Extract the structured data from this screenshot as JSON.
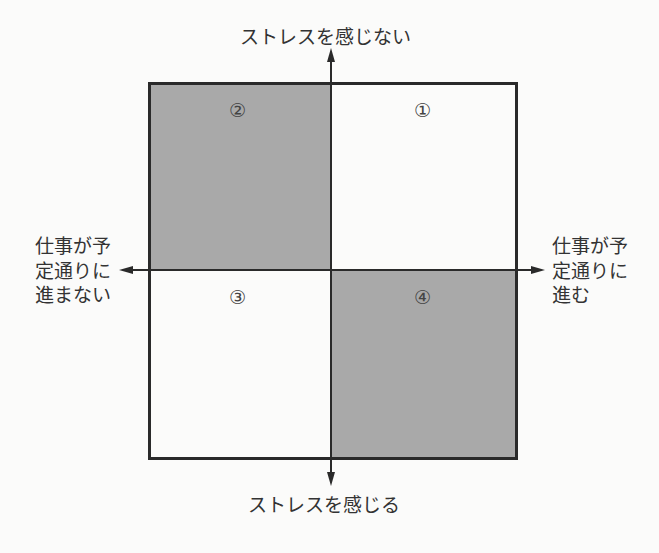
{
  "diagram": {
    "type": "quadrant-matrix",
    "axes": {
      "top": "ストレスを感じない",
      "bottom": "ストレスを感じる",
      "left": [
        "仕事が予",
        "定通りに",
        "進まない"
      ],
      "right": [
        "仕事が予",
        "定通りに",
        "進む"
      ]
    },
    "quadrants": [
      {
        "id": "q1",
        "label": "①",
        "position": "top-right",
        "fill": "#fbfbfa"
      },
      {
        "id": "q2",
        "label": "②",
        "position": "top-left",
        "fill": "#a9a9a9"
      },
      {
        "id": "q3",
        "label": "③",
        "position": "bottom-left",
        "fill": "#fbfbfa"
      },
      {
        "id": "q4",
        "label": "④",
        "position": "bottom-right",
        "fill": "#a9a9a9"
      }
    ],
    "colors": {
      "shaded": "#a9a9a9",
      "background": "#fbfbfa",
      "line": "#2a2a2a"
    }
  }
}
